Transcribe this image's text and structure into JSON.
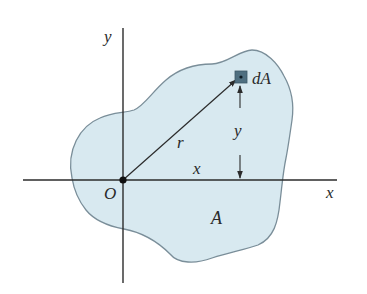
{
  "diagram": {
    "title": "",
    "colors": {
      "region_fill": "#d8e9f0",
      "region_stroke": "#7a8e99",
      "axis": "#2b2b2b",
      "element_fill": "#4f6f80",
      "element_dot": "#0d1a22",
      "text": "#2a2a2a"
    },
    "labels": {
      "y_axis": "y",
      "x_axis": "x",
      "origin": "O",
      "element": "dA",
      "radius": "r",
      "x_distance": "x",
      "y_distance": "y",
      "region": "A"
    },
    "elements": {
      "axes": [
        "x-axis",
        "y-axis"
      ],
      "region": "A",
      "area_element": "dA",
      "vectors": [
        "r from O to dA"
      ],
      "dimensions": [
        "x: horizontal distance from y-axis to dA",
        "y: vertical distance from x-axis to dA"
      ]
    }
  }
}
